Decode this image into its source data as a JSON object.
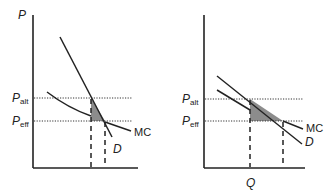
{
  "diagram": {
    "colors": {
      "line": "#222222",
      "shade": "#8c8c8c",
      "background": "#ffffff"
    },
    "panels": [
      {
        "id": "left",
        "y_axis_label": "P",
        "x_axis_label": "",
        "price_labels": {
          "alt_main": "P",
          "alt_sub": "alt",
          "eff_main": "P",
          "eff_sub": "eff"
        },
        "curves": {
          "mc_label": "MC",
          "d_label": "D"
        },
        "note": "Steep demand curve, MC crosses; shaded triangle between Palt and Peff"
      },
      {
        "id": "right",
        "y_axis_label": "",
        "x_axis_label": "Q",
        "price_labels": {
          "alt_main": "P",
          "alt_sub": "alt",
          "eff_main": "P",
          "eff_sub": "eff"
        },
        "curves": {
          "mc_label": "MC",
          "d_label": "D"
        },
        "note": "Flatter demand curve nearly parallel to MC; larger shaded triangle"
      }
    ]
  }
}
